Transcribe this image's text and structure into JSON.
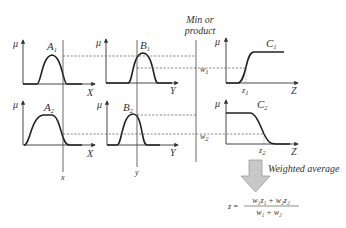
{
  "diagram": {
    "combine_label_line1": "Min or",
    "combine_label_line2": "product",
    "axis_mu": "μ",
    "rule1": {
      "antecedent1": {
        "label": "A",
        "sub": "1",
        "axis": "X"
      },
      "antecedent2": {
        "label": "B",
        "sub": "1",
        "axis": "Y"
      },
      "consequent": {
        "label": "C",
        "sub": "1",
        "axis": "Z",
        "point": "z",
        "point_sub": "1"
      },
      "weight": {
        "label": "w",
        "sub": "1"
      }
    },
    "rule2": {
      "antecedent1": {
        "label": "A",
        "sub": "2",
        "axis": "X"
      },
      "antecedent2": {
        "label": "B",
        "sub": "2",
        "axis": "Y"
      },
      "consequent": {
        "label": "C",
        "sub": "2",
        "axis": "Z",
        "point": "z",
        "point_sub": "2"
      },
      "weight": {
        "label": "w",
        "sub": "2"
      }
    },
    "input_x": "x",
    "input_y": "y",
    "aggregation_label": "Weighted average",
    "formula": {
      "lhs": "z =",
      "numerator": "w₁z₁ + w₂z₂",
      "denominator": "w₁ + w₂"
    }
  }
}
